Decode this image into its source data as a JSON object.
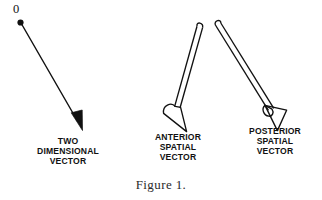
{
  "figure": {
    "caption": "Figure 1.",
    "origin_label": "0",
    "background_color": "#ffffff",
    "ink_color": "#111111",
    "width": 322,
    "height": 200
  },
  "vectors": [
    {
      "id": "two-dimensional-vector",
      "label_line1": "TWO",
      "label_line2": "DIMENSIONAL",
      "label_line3": "VECTOR",
      "style": "thin-line-solid-arrowhead",
      "origin_marker": "filled-dot",
      "origin_label": "0",
      "start_x": 20,
      "start_y": 22,
      "end_x": 82,
      "end_y": 130
    },
    {
      "id": "anterior-spatial-vector",
      "label_line1": "ANTERIOR",
      "label_line2": "SPATIAL",
      "label_line3": "VECTOR",
      "style": "hollow-tube-open-cone",
      "cone_orientation": "toward-viewer",
      "start_x": 200,
      "start_y": 23,
      "end_x": 180,
      "end_y": 130
    },
    {
      "id": "posterior-spatial-vector",
      "label_line1": "POSTERIOR",
      "label_line2": "SPATIAL",
      "label_line3": "VECTOR",
      "style": "hollow-tube-closed-cone",
      "cone_orientation": "away-from-viewer",
      "start_x": 218,
      "start_y": 22,
      "end_x": 278,
      "end_y": 128
    }
  ]
}
